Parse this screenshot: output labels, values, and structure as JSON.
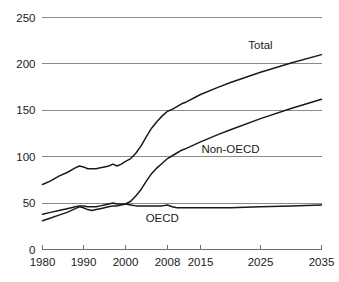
{
  "chart_data": {
    "type": "line",
    "title": "",
    "subtitle": "",
    "xlabel": "",
    "ylabel": "",
    "xlim": [
      1980,
      2035
    ],
    "ylim": [
      0,
      250
    ],
    "grid": true,
    "grid_axis": "y",
    "legend_position": "inline-annotations",
    "x_ticks": [
      "1980",
      "1990",
      "2000",
      "2008",
      "2015",
      "2025",
      "2035"
    ],
    "x_tick_values": [
      1980,
      1990,
      2000,
      2008,
      2015,
      2025,
      2035
    ],
    "y_ticks": [
      "0",
      "50",
      "100",
      "150",
      "200",
      "250"
    ],
    "y_tick_values": [
      0,
      50,
      100,
      150,
      200,
      250
    ],
    "x": [
      1980,
      1982,
      1984,
      1986,
      1988,
      1989,
      1990,
      1991,
      1992,
      1993,
      1994,
      1995,
      1996,
      1997,
      1998,
      1999,
      2000,
      2001,
      2002,
      2003,
      2004,
      2005,
      2006,
      2007,
      2008,
      2009,
      2010,
      2011,
      2012,
      2015,
      2018,
      2020,
      2025,
      2030,
      2035
    ],
    "series": [
      {
        "name": "Total",
        "label": "Total",
        "color": "#1a1a1a",
        "values": [
          70,
          74,
          79,
          83,
          88,
          90,
          89,
          87,
          87,
          87,
          88,
          89,
          90,
          92,
          90,
          92,
          95,
          98,
          104,
          112,
          122,
          131,
          138,
          144,
          149,
          151,
          154,
          157,
          159,
          167,
          175,
          180,
          191,
          201,
          210
        ]
      },
      {
        "name": "Non-OECD",
        "label": "Non-OECD",
        "color": "#1a1a1a",
        "values": [
          31,
          34,
          37,
          40,
          44,
          46,
          45,
          43,
          42,
          43,
          44,
          45,
          46,
          47,
          47,
          48,
          49,
          52,
          58,
          65,
          74,
          82,
          88,
          93,
          98,
          101,
          104,
          107,
          109,
          116,
          124,
          129,
          141,
          152,
          162
        ]
      },
      {
        "name": "OECD",
        "label": "OECD",
        "color": "#1a1a1a",
        "values": [
          38,
          40,
          42,
          44,
          46,
          47,
          47,
          46,
          46,
          46,
          47,
          48,
          49,
          50,
          49,
          49,
          49,
          48,
          47,
          47,
          47,
          47,
          47,
          47,
          48,
          46,
          45,
          45,
          45,
          45,
          45,
          45,
          46,
          47,
          48
        ]
      }
    ],
    "annotations": [
      {
        "text": "Total",
        "x": 2025,
        "y": 216,
        "name": "total"
      },
      {
        "text": "Non-OECD",
        "x": 2020,
        "y": 104,
        "name": "non-oecd"
      },
      {
        "text": "OECD",
        "x": 2007,
        "y": 30,
        "name": "oecd"
      }
    ],
    "colors": {
      "line": "#1a1a1a",
      "grid": "#8a8a8a",
      "axis": "#6f6f6f",
      "text": "#1a1a1a",
      "background": "#ffffff"
    }
  }
}
